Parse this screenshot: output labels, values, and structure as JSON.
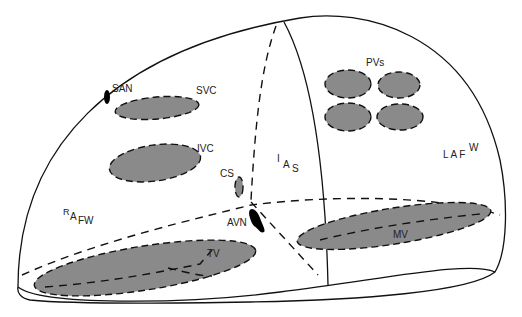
{
  "diagram": {
    "colors": {
      "structure_fill": "#8a8a8a",
      "line": "#111111",
      "background": "#ffffff"
    },
    "labels": {
      "san": "SAN",
      "svc": "SVC",
      "ivc": "IVC",
      "cs": "CS",
      "avn": "AVN",
      "tv": "TV",
      "mv": "MV",
      "pvs": "PVs",
      "ias": {
        "a": "I",
        "b": "A",
        "c": "S"
      },
      "rafw": {
        "a": "R",
        "b": "A",
        "c": "FW"
      },
      "lafw": {
        "a": "L A F",
        "b": "W"
      }
    }
  }
}
